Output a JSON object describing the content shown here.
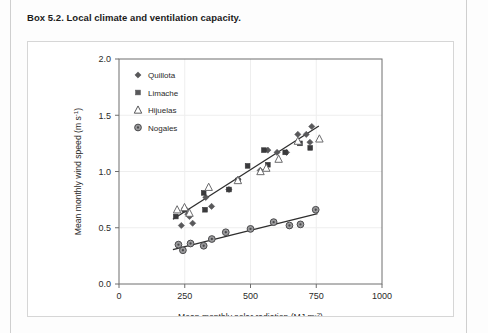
{
  "box": {
    "title": "Box 5.2. Local climate and ventilation capacity."
  },
  "chart_data": {
    "type": "scatter",
    "title": "",
    "xlabel": "Mean monthly solar radiation (MJ m-2)",
    "xlabel_base": "Mean monthly solar radiation (MJ m",
    "xlabel_sup": "-2",
    "xlabel_tail": ")",
    "ylabel": "Mean monthly wind speed (m s-1)",
    "ylabel_base": "Mean monthly wind speed (m s",
    "ylabel_sup": "-1",
    "ylabel_tail": ")",
    "xlim": [
      0,
      1000
    ],
    "ylim": [
      0.0,
      2.0
    ],
    "xticks": [
      0,
      250,
      500,
      750,
      1000
    ],
    "xtick_labels": [
      "0",
      "250",
      "500",
      "750",
      "1000"
    ],
    "yticks": [
      0.0,
      0.5,
      1.0,
      1.5,
      2.0
    ],
    "ytick_labels": [
      "0.0",
      "0.5",
      "1.0",
      "1.5",
      "2.0"
    ],
    "grid": true,
    "grid_color": "#eeeeee",
    "legend_position": "top-left",
    "marker_color": "#58585a",
    "trendline_color": "#2e2e2e",
    "series": [
      {
        "name": "Quillota",
        "marker": "diamond",
        "color": "#58585a",
        "points": [
          [
            237,
            0.52
          ],
          [
            250,
            0.67
          ],
          [
            262,
            0.62
          ],
          [
            268,
            0.6
          ],
          [
            280,
            0.54
          ],
          [
            330,
            0.77
          ],
          [
            352,
            0.69
          ],
          [
            418,
            0.84
          ],
          [
            452,
            0.93
          ],
          [
            537,
            1.01
          ],
          [
            566,
            1.19
          ],
          [
            601,
            1.17
          ],
          [
            637,
            1.17
          ],
          [
            680,
            1.33
          ],
          [
            712,
            1.33
          ],
          [
            726,
            1.26
          ],
          [
            733,
            1.4
          ]
        ]
      },
      {
        "name": "Limache",
        "marker": "square",
        "color": "#3a3a3c",
        "points": [
          [
            216,
            0.6
          ],
          [
            249,
            0.66
          ],
          [
            322,
            0.81
          ],
          [
            327,
            0.66
          ],
          [
            418,
            0.84
          ],
          [
            452,
            0.92
          ],
          [
            489,
            1.05
          ],
          [
            551,
            1.19
          ],
          [
            566,
            1.06
          ],
          [
            632,
            1.17
          ],
          [
            688,
            1.25
          ],
          [
            727,
            1.21
          ]
        ]
      },
      {
        "name": "Hijuelas",
        "marker": "triangle",
        "color": "#6b6b6d",
        "points": [
          [
            221,
            0.66
          ],
          [
            249,
            0.68
          ],
          [
            268,
            0.63
          ],
          [
            341,
            0.86
          ],
          [
            452,
            0.92
          ],
          [
            538,
            1.0
          ],
          [
            560,
            1.03
          ],
          [
            607,
            1.11
          ],
          [
            680,
            1.27
          ],
          [
            762,
            1.29
          ]
        ]
      },
      {
        "name": "Nogales",
        "marker": "circle",
        "color": "#7a7a7c",
        "points": [
          [
            226,
            0.35
          ],
          [
            243,
            0.3
          ],
          [
            272,
            0.36
          ],
          [
            322,
            0.34
          ],
          [
            353,
            0.4
          ],
          [
            406,
            0.46
          ],
          [
            500,
            0.49
          ],
          [
            588,
            0.55
          ],
          [
            648,
            0.52
          ],
          [
            690,
            0.53
          ],
          [
            748,
            0.66
          ]
        ]
      }
    ],
    "trendlines": [
      {
        "name": "upper-trend",
        "x1": 205,
        "y1": 0.575,
        "x2": 760,
        "y2": 1.405
      },
      {
        "name": "lower-trend",
        "x1": 205,
        "y1": 0.305,
        "x2": 755,
        "y2": 0.625
      }
    ],
    "legend": [
      {
        "label": "Quillota",
        "marker": "diamond"
      },
      {
        "label": "Limache",
        "marker": "square"
      },
      {
        "label": "Hijuelas",
        "marker": "triangle"
      },
      {
        "label": "Nogales",
        "marker": "circle"
      }
    ]
  }
}
